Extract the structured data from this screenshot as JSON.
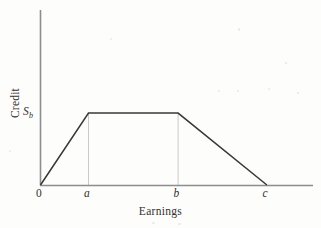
{
  "figure": {
    "background_color": "#fdfdfc",
    "curve_color": "#3a3835",
    "axis_color": "#8d8d8d",
    "guide_color": "#c9c9c9"
  },
  "axes": {
    "y_label": "Credit",
    "x_label": "Earnings",
    "origin_label": "0",
    "y_tick_label": "S",
    "y_tick_subscript": "b"
  },
  "x_ticks": [
    {
      "label": "0"
    },
    {
      "label": "a"
    },
    {
      "label": "b"
    },
    {
      "label": "c"
    }
  ],
  "chart_data": {
    "type": "line",
    "title": "",
    "subtitle": "",
    "xlabel": "Earnings",
    "ylabel": "Credit",
    "grid": false,
    "legend": "none",
    "xlim": [
      0,
      1
    ],
    "ylim": [
      0,
      1
    ],
    "x_tick_labels": [
      "0",
      "a",
      "b",
      "c"
    ],
    "x_tick_values": [
      0,
      0.176,
      0.505,
      0.831
    ],
    "y_tick_labels": [
      "S_b"
    ],
    "y_tick_values": [
      0.411
    ],
    "annotations": [
      "Phase-in: credit rises linearly from 0 at earnings 0 to S_b at earnings a",
      "Plateau: credit stays at maximum S_b between earnings a and b",
      "Phase-out: credit falls linearly from S_b at earnings b to 0 at earnings c"
    ],
    "guide_lines": [
      {
        "label": "a",
        "x": 0.176,
        "from_y": 0,
        "to_y": 0.411
      },
      {
        "label": "b",
        "x": 0.505,
        "from_y": 0,
        "to_y": 0.411
      }
    ],
    "series": [
      {
        "name": "Credit schedule",
        "x": [
          0,
          0.176,
          0.505,
          0.831
        ],
        "y": [
          0,
          0.411,
          0.411,
          0
        ],
        "point_labels": [
          "0",
          "a",
          "b",
          "c"
        ]
      }
    ]
  }
}
